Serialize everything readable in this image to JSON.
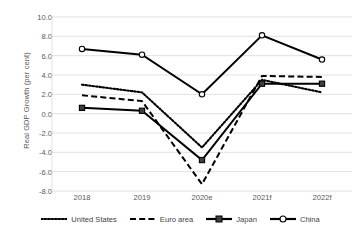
{
  "chart_data": {
    "type": "line",
    "title": "",
    "xlabel": "",
    "ylabel": "Real GDP Growth (per cent)",
    "categories": [
      "2018",
      "2019",
      "2020e",
      "2021f",
      "2022f"
    ],
    "ylim": [
      -8.0,
      10.0
    ],
    "ytick_labels": [
      "10.0",
      "8.0",
      "6.0",
      "4.0",
      "2.0",
      "0.0",
      "-2.0",
      "-4.0",
      "-6.0",
      "-8.0"
    ],
    "ytick_values": [
      10.0,
      8.0,
      6.0,
      4.0,
      2.0,
      0.0,
      -2.0,
      -4.0,
      -6.0,
      -8.0
    ],
    "grid": true,
    "legend_position": "bottom",
    "series": [
      {
        "name": "United States",
        "style": "dotted",
        "marker": "none",
        "color": "#000000",
        "values": [
          3.0,
          2.2,
          -3.5,
          3.5,
          2.2
        ]
      },
      {
        "name": "Euro area",
        "style": "dashed",
        "marker": "none",
        "color": "#000000",
        "values": [
          1.9,
          1.3,
          -7.3,
          3.9,
          3.8
        ]
      },
      {
        "name": "Japan",
        "style": "solid",
        "marker": "square",
        "color": "#000000",
        "values": [
          0.6,
          0.3,
          -4.8,
          3.1,
          3.1
        ]
      },
      {
        "name": "China",
        "style": "solid",
        "marker": "circle",
        "color": "#000000",
        "values": [
          6.7,
          6.1,
          2.0,
          8.1,
          5.6
        ]
      }
    ]
  }
}
